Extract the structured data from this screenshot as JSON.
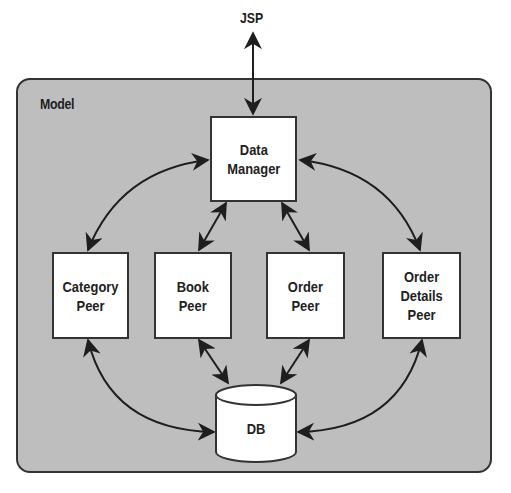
{
  "diagram": {
    "external": {
      "label": "JSP"
    },
    "container": {
      "label": "Model",
      "fill": "#bebebe",
      "border": "#333333"
    },
    "nodes": {
      "data_manager": {
        "label": "Data\nManager"
      },
      "category_peer": {
        "label": "Category\nPeer"
      },
      "book_peer": {
        "label": "Book\nPeer"
      },
      "order_peer": {
        "label": "Order\nPeer"
      },
      "order_details_peer": {
        "label": "Order\nDetails\nPeer"
      },
      "db": {
        "label": "DB",
        "shape": "cylinder"
      }
    },
    "edges": [
      {
        "from": "JSP",
        "to": "Data Manager",
        "direction": "bidirectional"
      },
      {
        "from": "Data Manager",
        "to": "Category Peer",
        "direction": "bidirectional"
      },
      {
        "from": "Data Manager",
        "to": "Book Peer",
        "direction": "bidirectional"
      },
      {
        "from": "Data Manager",
        "to": "Order Peer",
        "direction": "bidirectional"
      },
      {
        "from": "Data Manager",
        "to": "Order Details Peer",
        "direction": "bidirectional"
      },
      {
        "from": "Category Peer",
        "to": "DB",
        "direction": "bidirectional"
      },
      {
        "from": "Book Peer",
        "to": "DB",
        "direction": "bidirectional"
      },
      {
        "from": "Order Peer",
        "to": "DB",
        "direction": "bidirectional"
      },
      {
        "from": "Order Details Peer",
        "to": "DB",
        "direction": "bidirectional"
      }
    ]
  }
}
